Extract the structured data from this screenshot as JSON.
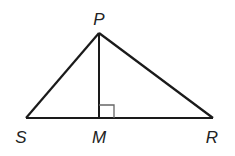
{
  "diagram": {
    "type": "triangle-with-altitude",
    "points": {
      "P": {
        "label": "P",
        "x": 99,
        "y": 33,
        "lx": 99,
        "ly": 25
      },
      "S": {
        "label": "S",
        "x": 26,
        "y": 118,
        "lx": 21,
        "ly": 143
      },
      "M": {
        "label": "M",
        "x": 99,
        "y": 118,
        "lx": 99,
        "ly": 143
      },
      "R": {
        "label": "R",
        "x": 213,
        "y": 118,
        "lx": 212,
        "ly": 143
      }
    },
    "segments": [
      "PS",
      "PR",
      "SR",
      "PM"
    ],
    "right_angle_at": "M",
    "stroke_color": "#1a1a1a",
    "right_angle_color": "#666666"
  }
}
